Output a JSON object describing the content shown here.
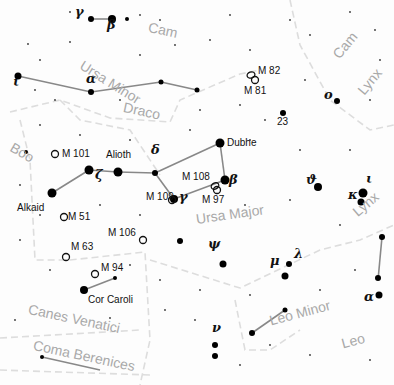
{
  "map": {
    "type": "star-chart",
    "constellations": [
      {
        "name": "Cam",
        "x": 150,
        "y": 20,
        "rot": 12
      },
      {
        "name": "Ursa Minor",
        "x": 85,
        "y": 58,
        "rot": 32
      },
      {
        "name": "Cam",
        "x": 330,
        "y": 52,
        "rot": -50
      },
      {
        "name": "Draco",
        "x": 125,
        "y": 100,
        "rot": 12
      },
      {
        "name": "Lynx",
        "x": 355,
        "y": 88,
        "rot": -50
      },
      {
        "name": "Boo",
        "x": 15,
        "y": 140,
        "rot": 30
      },
      {
        "name": "Ursa Major",
        "x": 195,
        "y": 212,
        "rot": -8
      },
      {
        "name": "Lynx",
        "x": 350,
        "y": 208,
        "rot": -40
      },
      {
        "name": "Canes Venatici",
        "x": 30,
        "y": 302,
        "rot": 12
      },
      {
        "name": "Coma Berenices",
        "x": 35,
        "y": 338,
        "rot": 12
      },
      {
        "name": "Leo Minor",
        "x": 268,
        "y": 314,
        "rot": -15
      },
      {
        "name": "Leo",
        "x": 340,
        "y": 337,
        "rot": -15
      }
    ],
    "named_stars": [
      {
        "name": "Dubhe",
        "x": 220,
        "y": 143
      },
      {
        "name": "Alioth",
        "x": 106,
        "y": 167
      },
      {
        "name": "Alkaid",
        "x": 52,
        "y": 195
      },
      {
        "name": "Cor Caroli",
        "x": 84,
        "y": 291
      }
    ],
    "greek_labels": [
      {
        "g": "γ",
        "x": 75,
        "y": 13
      },
      {
        "g": "β",
        "x": 107,
        "y": 26
      },
      {
        "g": "ι",
        "x": 13,
        "y": 83
      },
      {
        "g": "α",
        "x": 86,
        "y": 80
      },
      {
        "g": "δ",
        "x": 151,
        "y": 151
      },
      {
        "g": "ζ",
        "x": 95,
        "y": 176
      },
      {
        "g": "γ",
        "x": 179,
        "y": 198
      },
      {
        "g": "β",
        "x": 229,
        "y": 181
      },
      {
        "g": "ο",
        "x": 324,
        "y": 96
      },
      {
        "g": "ϑ",
        "x": 306,
        "y": 181
      },
      {
        "g": "ι",
        "x": 366,
        "y": 180
      },
      {
        "g": "κ",
        "x": 348,
        "y": 196
      },
      {
        "g": "ψ",
        "x": 208,
        "y": 245
      },
      {
        "g": "μ",
        "x": 270,
        "y": 262
      },
      {
        "g": "λ",
        "x": 294,
        "y": 255
      },
      {
        "g": "ν",
        "x": 212,
        "y": 329
      },
      {
        "g": "α",
        "x": 364,
        "y": 298
      }
    ],
    "messier": [
      {
        "id": "M 82",
        "x": 258,
        "y": 66,
        "ox": 251,
        "oy": 75
      },
      {
        "id": "M 81",
        "x": 244,
        "y": 86,
        "ox": 255,
        "oy": 80
      },
      {
        "id": "M 101",
        "x": 62,
        "y": 149,
        "ox": 55,
        "oy": 154
      },
      {
        "id": "M 109",
        "x": 146,
        "y": 192,
        "ox": 172,
        "oy": 200
      },
      {
        "id": "M 108",
        "x": 182,
        "y": 172,
        "ox": 215,
        "oy": 186
      },
      {
        "id": "M 97",
        "x": 202,
        "y": 195,
        "ox": 217,
        "oy": 190
      },
      {
        "id": "M 51",
        "x": 68,
        "y": 212,
        "ox": 64,
        "oy": 217
      },
      {
        "id": "M 106",
        "x": 108,
        "y": 228,
        "ox": 143,
        "oy": 240
      },
      {
        "id": "M 63",
        "x": 71,
        "y": 242,
        "ox": 66,
        "oy": 257
      },
      {
        "id": "M 94",
        "x": 101,
        "y": 263,
        "ox": 95,
        "oy": 274
      }
    ],
    "numbers": [
      {
        "t": "23",
        "x": 283,
        "y": 117
      }
    ]
  }
}
